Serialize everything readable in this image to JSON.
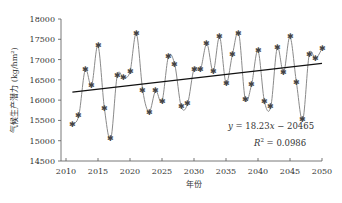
{
  "chart_data": {
    "type": "line",
    "title": "",
    "xlabel": "年份",
    "ylabel": "气候生产潜力 (kg/hm²)",
    "xlim": [
      2010,
      2050
    ],
    "ylim": [
      14500,
      18000
    ],
    "xticks": [
      2010,
      2015,
      2020,
      2025,
      2030,
      2035,
      2040,
      2045,
      2050
    ],
    "yticks": [
      14500,
      15000,
      15500,
      16000,
      16500,
      17000,
      17500,
      18000
    ],
    "grid": false,
    "legend": null,
    "series": [
      {
        "name": "气候生产潜力",
        "style": "smoothed line with star markers",
        "color": "#8a8a8a",
        "x": [
          2011,
          2012,
          2013,
          2014,
          2015,
          2016,
          2017,
          2018,
          2019,
          2020,
          2021,
          2022,
          2023,
          2024,
          2025,
          2026,
          2027,
          2028,
          2029,
          2030,
          2031,
          2032,
          2033,
          2034,
          2035,
          2036,
          2037,
          2038,
          2039,
          2040,
          2041,
          2042,
          2043,
          2044,
          2045,
          2046,
          2047,
          2048,
          2049,
          2050
        ],
        "values": [
          15400,
          15620,
          16750,
          16360,
          17340,
          15800,
          15050,
          16600,
          16550,
          16700,
          17640,
          16230,
          15710,
          16230,
          15970,
          17070,
          16870,
          15840,
          15910,
          16770,
          16750,
          17390,
          16710,
          17560,
          16420,
          17120,
          17640,
          16030,
          16390,
          17220,
          15970,
          15840,
          17290,
          16680,
          17560,
          16440,
          15520,
          17120,
          17020,
          17270
        ]
      }
    ],
    "trendline": {
      "type": "linear",
      "slope": 18.23,
      "intercept": -20465,
      "x_range": [
        2011,
        2050
      ],
      "color": "#111111"
    },
    "annotations": [
      {
        "text": "y = 18.23x − 20465",
        "x": 2033,
        "y": 15150
      },
      {
        "text": "R² = 0.0986",
        "x": 2037,
        "y": 14750
      }
    ]
  },
  "labels": {
    "x_axis_title": "年份",
    "y_axis_title": "气候生产潜力 (kg/hm²)",
    "equation_y": "y",
    "equation_eq": " = 18.23",
    "equation_x": "x",
    "equation_rest": " − 20465",
    "r2_R": "R",
    "r2_sup": "2",
    "r2_rest": " = 0.0986"
  }
}
